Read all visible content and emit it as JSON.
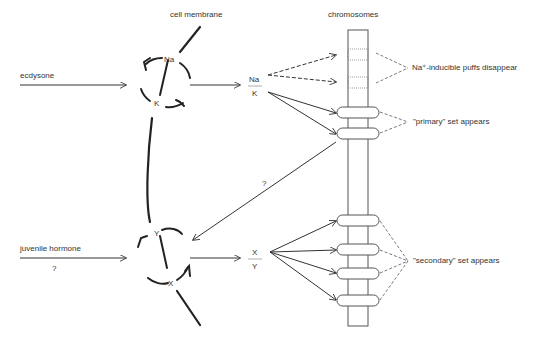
{
  "labels": {
    "cell_membrane": "cell membrane",
    "chromosomes": "chromosomes",
    "ecdysone": "ecdysone",
    "juvenile_hormone": "juvenile hormone",
    "jh_question": "?",
    "feedback_question": "?",
    "na": "Na",
    "k": "K",
    "y": "Y",
    "x": "X",
    "ratio_top_num": "Na",
    "ratio_top_den": "K",
    "ratio_bot_num": "X",
    "ratio_bot_den": "Y",
    "puffs_disappear": "Na⁺-inducible puffs disappear",
    "primary_set": "\"primary\" set appears",
    "secondary_set": "\"secondary\" set appears"
  }
}
